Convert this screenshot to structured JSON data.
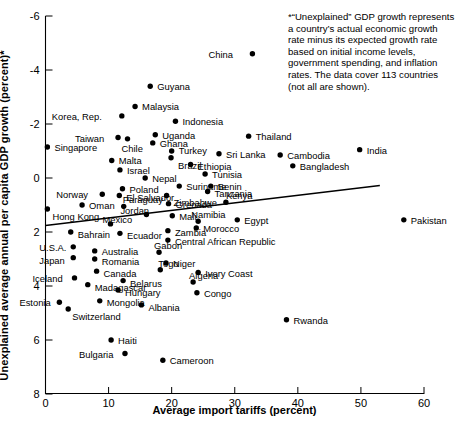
{
  "chart_data": {
    "type": "scatter",
    "title": "",
    "xlabel": "Average import tariffs (percent)",
    "ylabel": "Unexplained average annual per capita GDP growth (percent)*",
    "xlim": [
      0,
      60
    ],
    "ylim": [
      -6,
      8
    ],
    "xticks": [
      0,
      10,
      20,
      30,
      40,
      50,
      60
    ],
    "yticks": [
      -6,
      -4,
      -2,
      0,
      2,
      4,
      6,
      8
    ],
    "grid": false,
    "legend": null,
    "annotation": "*“Unexplained” GDP growth represents a country’s actual economic growth rate minus its expected growth rate based on initial income levels, government spending, and inflation rates. The data cover 113 countries (not all are shown).",
    "trendline": {
      "x0": 0,
      "y0": 0.24,
      "x1": 53,
      "y1": 1.72
    },
    "points": [
      {
        "label": "China",
        "x": 32.8,
        "y": 6.6,
        "lx": -44,
        "ly": -4
      },
      {
        "label": "Guyana",
        "x": 16.6,
        "y": 5.4,
        "lx": 7,
        "ly": -4
      },
      {
        "label": "Malaysia",
        "x": 14.2,
        "y": 4.65,
        "lx": 7,
        "ly": -4
      },
      {
        "label": "Korea, Rep.",
        "x": 12.1,
        "y": 4.3,
        "lx": -70,
        "ly": -4
      },
      {
        "label": "Indonesia",
        "x": 20.6,
        "y": 4.1,
        "lx": 7,
        "ly": -4
      },
      {
        "label": "Uganda",
        "x": 17.4,
        "y": 3.6,
        "lx": 7,
        "ly": -4
      },
      {
        "label": "Taiwan",
        "x": 11.5,
        "y": 3.5,
        "lx": -43,
        "ly": -4
      },
      {
        "label": "Chile",
        "x": 13.0,
        "y": 3.45,
        "lx": -6,
        "ly": 5
      },
      {
        "label": "Ghana",
        "x": 17.0,
        "y": 3.3,
        "lx": 7,
        "ly": -4
      },
      {
        "label": "Singapore",
        "x": 0.3,
        "y": 3.15,
        "lx": 7,
        "ly": -4
      },
      {
        "label": "Turkey",
        "x": 20.0,
        "y": 3.0,
        "lx": 7,
        "ly": -5
      },
      {
        "label": "Sri Lanka",
        "x": 27.5,
        "y": 2.9,
        "lx": 7,
        "ly": -4
      },
      {
        "label": "Brazil",
        "x": 19.9,
        "y": 2.75,
        "lx": 7,
        "ly": 3
      },
      {
        "label": "Malta",
        "x": 10.5,
        "y": 2.65,
        "lx": 7,
        "ly": -4
      },
      {
        "label": "Ethiopia",
        "x": 23.0,
        "y": 2.5,
        "lx": 7,
        "ly": -3
      },
      {
        "label": "Israel",
        "x": 11.8,
        "y": 2.3,
        "lx": 7,
        "ly": -4
      },
      {
        "label": "Thailand",
        "x": 32.2,
        "y": 3.55,
        "lx": 7,
        "ly": -4
      },
      {
        "label": "Cambodia",
        "x": 37.2,
        "y": 2.85,
        "lx": 7,
        "ly": -4
      },
      {
        "label": "India",
        "x": 49.8,
        "y": 3.05,
        "lx": 7,
        "ly": -4
      },
      {
        "label": "Bangladesh",
        "x": 39.2,
        "y": 2.45,
        "lx": 7,
        "ly": -4
      },
      {
        "label": "Tunisia",
        "x": 25.3,
        "y": 2.15,
        "lx": 7,
        "ly": -4
      },
      {
        "label": "Nepal",
        "x": 15.8,
        "y": 2.0,
        "lx": 7,
        "ly": -4
      },
      {
        "label": "Suriname",
        "x": 21.2,
        "y": 1.7,
        "lx": 7,
        "ly": -4
      },
      {
        "label": "Benin",
        "x": 26.2,
        "y": 1.7,
        "lx": 7,
        "ly": -4
      },
      {
        "label": "Poland",
        "x": 12.2,
        "y": 1.6,
        "lx": 7,
        "ly": -4
      },
      {
        "label": "Norway",
        "x": 9.0,
        "y": 1.4,
        "lx": -46,
        "ly": -4
      },
      {
        "label": "El Salvador",
        "x": 11.7,
        "y": 1.35,
        "lx": 7,
        "ly": -3
      },
      {
        "label": "Zimbabwe",
        "x": 19.2,
        "y": 1.35,
        "lx": 7,
        "ly": 2
      },
      {
        "label": "Tanzania",
        "x": 25.7,
        "y": 1.5,
        "lx": 7,
        "ly": -3
      },
      {
        "label": "Grenada",
        "x": 19.5,
        "y": 1.05,
        "lx": 7,
        "ly": -4
      },
      {
        "label": "Paraguay",
        "x": 12.4,
        "y": 0.95,
        "lx": -1,
        "ly": -11
      },
      {
        "label": "Oman",
        "x": 5.8,
        "y": 1.0,
        "lx": 7,
        "ly": -4
      },
      {
        "label": "Kenya",
        "x": 28.6,
        "y": 1.1,
        "lx": 0,
        "ly": -11
      },
      {
        "label": "Hong Kong",
        "x": 0.3,
        "y": 0.85,
        "lx": 5,
        "ly": 3
      },
      {
        "label": "Jordan",
        "x": 16.0,
        "y": 0.65,
        "lx": -26,
        "ly": -8
      },
      {
        "label": "Mali",
        "x": 20.1,
        "y": 0.6,
        "lx": 7,
        "ly": -4
      },
      {
        "label": "Namibia",
        "x": 24.2,
        "y": 0.4,
        "lx": -7,
        "ly": -11
      },
      {
        "label": "Mexico",
        "x": 10.3,
        "y": 0.3,
        "lx": -8,
        "ly": -9
      },
      {
        "label": "Egypt",
        "x": 30.4,
        "y": 0.45,
        "lx": 7,
        "ly": -4
      },
      {
        "label": "Bahrain",
        "x": 4.0,
        "y": 0.0,
        "lx": 7,
        "ly": -2
      },
      {
        "label": "Zambia",
        "x": 19.4,
        "y": 0.05,
        "lx": 7,
        "ly": -3
      },
      {
        "label": "Morocco",
        "x": 23.9,
        "y": 0.15,
        "lx": 7,
        "ly": -4
      },
      {
        "label": "Ecuador",
        "x": 11.8,
        "y": -0.05,
        "lx": 7,
        "ly": -2
      },
      {
        "label": "Pakistan",
        "x": 56.8,
        "y": 0.45,
        "lx": 7,
        "ly": -4
      },
      {
        "label": "Central African Republic",
        "x": 19.4,
        "y": -0.3,
        "lx": 7,
        "ly": -3
      },
      {
        "label": "U.S.A.",
        "x": 4.4,
        "y": -0.55,
        "lx": -34,
        "ly": -4
      },
      {
        "label": "Australia",
        "x": 7.8,
        "y": -0.7,
        "lx": 7,
        "ly": -4
      },
      {
        "label": "Gabon",
        "x": 18.0,
        "y": -0.75,
        "lx": -5,
        "ly": -11
      },
      {
        "label": "Japan",
        "x": 4.4,
        "y": -0.95,
        "lx": -34,
        "ly": -2
      },
      {
        "label": "Romania",
        "x": 7.8,
        "y": -1.0,
        "lx": 7,
        "ly": -2
      },
      {
        "label": "Niger",
        "x": 19.1,
        "y": -1.15,
        "lx": 7,
        "ly": -4
      },
      {
        "label": "Canada",
        "x": 8.1,
        "y": -1.45,
        "lx": 7,
        "ly": -2
      },
      {
        "label": "Togo",
        "x": 18.2,
        "y": -1.4,
        "lx": -2,
        "ly": -11
      },
      {
        "label": "Ivory Coast",
        "x": 24.2,
        "y": -1.5,
        "lx": 7,
        "ly": -4
      },
      {
        "label": "Iceland",
        "x": 4.6,
        "y": -1.7,
        "lx": -42,
        "ly": -4
      },
      {
        "label": "Belarus",
        "x": 12.3,
        "y": -1.8,
        "lx": 7,
        "ly": -2
      },
      {
        "label": "Algeria",
        "x": 23.4,
        "y": -1.85,
        "lx": -4,
        "ly": -11
      },
      {
        "label": "Madagascar",
        "x": 6.7,
        "y": -1.95,
        "lx": 7,
        "ly": -2
      },
      {
        "label": "Hungary",
        "x": 11.5,
        "y": -2.15,
        "lx": 7,
        "ly": -2
      },
      {
        "label": "Congo",
        "x": 24.0,
        "y": -2.25,
        "lx": 7,
        "ly": -4
      },
      {
        "label": "Estonia",
        "x": 2.2,
        "y": -2.6,
        "lx": -40,
        "ly": -4
      },
      {
        "label": "Mongolia",
        "x": 8.6,
        "y": -2.55,
        "lx": 7,
        "ly": -3
      },
      {
        "label": "Albania",
        "x": 15.2,
        "y": -2.7,
        "lx": 7,
        "ly": -2
      },
      {
        "label": "Switzerland",
        "x": 3.6,
        "y": -2.85,
        "lx": 4,
        "ly": 3
      },
      {
        "label": "Haiti",
        "x": 10.4,
        "y": -4.0,
        "lx": 7,
        "ly": -4
      },
      {
        "label": "Bulgaria",
        "x": 12.6,
        "y": -4.5,
        "lx": -46,
        "ly": -4
      },
      {
        "label": "Cameroon",
        "x": 18.6,
        "y": -4.75,
        "lx": 7,
        "ly": -4
      },
      {
        "label": "Rwanda",
        "x": 38.2,
        "y": -3.25,
        "lx": 7,
        "ly": -4
      }
    ]
  },
  "axes": {
    "xtick_labels": [
      "0",
      "10",
      "20",
      "30",
      "40",
      "50",
      "60"
    ],
    "ytick_labels": [
      "-6",
      "-4",
      "-2",
      "0",
      "2",
      "4",
      "6",
      "8"
    ],
    "xlabel": "Average import tariffs (percent)",
    "ylabel": "Unexplained average annual per capita GDP growth (percent)*"
  },
  "annotation": {
    "text": "*“Unexplained” GDP growth represents a country’s actual economic growth rate minus its expected growth rate based on initial income levels, government spending, and inflation rates. The data cover 113 countries (not all are shown)."
  },
  "colors": {
    "point": "#000000",
    "axis": "#000000",
    "trendline": "#000000",
    "background": "#ffffff"
  }
}
